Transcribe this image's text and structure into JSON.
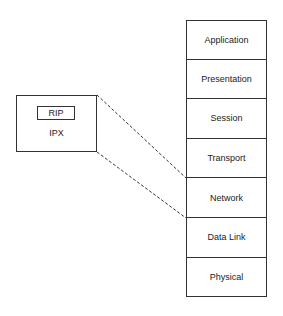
{
  "osi_stack": {
    "layers": [
      "Application",
      "Presentation",
      "Session",
      "Transport",
      "Network",
      "Data Link",
      "Physical"
    ]
  },
  "protocol_box": {
    "label": "IPX",
    "inner_label": "RIP"
  },
  "mapping": {
    "from": "IPX",
    "to": "Network",
    "style": "dashed"
  }
}
